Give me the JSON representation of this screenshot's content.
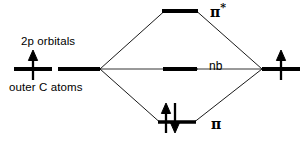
{
  "diagram": {
    "type": "molecular-orbital-energy-diagram",
    "background_color": "#ffffff",
    "line_color": "#000000",
    "width": 307,
    "height": 149,
    "labels": {
      "left_top": "2p orbitals",
      "left_bottom": "outer C atoms",
      "antibonding": "π",
      "antibonding_star": "*",
      "nonbonding": "nb",
      "bonding": "π"
    },
    "levels": [
      {
        "id": "antibonding",
        "name": "pi-star",
        "label": "π*",
        "energy_rank": 3,
        "x1": 162,
        "x2": 198,
        "y": 11,
        "electrons": 0,
        "arrows": []
      },
      {
        "id": "nonbonding",
        "name": "nb",
        "label": "nb",
        "energy_rank": 2,
        "x1": 163,
        "x2": 197,
        "y": 69,
        "electrons": 0,
        "arrows": []
      },
      {
        "id": "bonding",
        "name": "pi",
        "label": "π",
        "energy_rank": 1,
        "x1": 158,
        "x2": 196,
        "y": 122,
        "electrons": 2,
        "arrows": [
          "up",
          "down"
        ]
      }
    ],
    "fragment_levels": [
      {
        "id": "left-fragment",
        "name": "outer-carbon-2p",
        "side": "left",
        "y": 69,
        "segments": [
          [
            14,
            52
          ],
          [
            58,
            100
          ]
        ],
        "electrons": 1,
        "arrows": [
          "up"
        ],
        "arrow_x": 33
      },
      {
        "id": "right-fragment",
        "name": "central-carbon-2p",
        "side": "right",
        "y": 69,
        "segments": [
          [
            262,
            300
          ]
        ],
        "electrons": 1,
        "arrows": [
          "up"
        ],
        "arrow_x": 281
      }
    ],
    "correlation_lines": [
      {
        "from": [
          100,
          69
        ],
        "to": [
          162,
          11
        ]
      },
      {
        "from": [
          100,
          69
        ],
        "to": [
          158,
          122
        ]
      },
      {
        "from": [
          100,
          69
        ],
        "to": [
          197,
          69
        ]
      },
      {
        "from": [
          262,
          69
        ],
        "to": [
          198,
          11
        ]
      },
      {
        "from": [
          262,
          69
        ],
        "to": [
          196,
          122
        ]
      },
      {
        "from": [
          262,
          69
        ],
        "to": [
          163,
          69
        ]
      }
    ]
  }
}
